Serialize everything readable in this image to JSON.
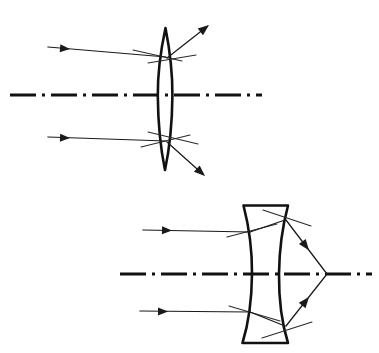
{
  "figure": {
    "width": 379,
    "height": 353,
    "background_color": "#ffffff",
    "ink_color": "#111111",
    "ray_color": "#1a1a1a"
  },
  "panels": [
    {
      "id": "top-panel",
      "name": "biconvex-lens-diagram",
      "lens_type": "biconvex",
      "lens_label": "converging lens",
      "optical_axis": {
        "label": "optical-axis",
        "y": 95,
        "x_start": 10,
        "x_end": 262,
        "style": "dash-dot"
      },
      "lens": {
        "center_x": 165,
        "top_y": 28,
        "bottom_y": 170,
        "half_width": 7,
        "left_vertex_x": 158,
        "right_vertex_x": 172
      },
      "incident_rays": [
        {
          "name": "incident-ray-upper",
          "x_start": 48,
          "y_start": 47,
          "x_end": 166,
          "y_end": 57,
          "arrow_at_x": 68,
          "arrow_at_y": 48,
          "direction": "rightward"
        },
        {
          "name": "incident-ray-lower",
          "x_start": 48,
          "y_start": 137,
          "x_end": 166,
          "y_end": 141,
          "arrow_at_x": 68,
          "arrow_at_y": 137,
          "direction": "rightward"
        }
      ],
      "refracted_rays": [
        {
          "name": "refracted-ray-upper",
          "x_start": 167,
          "y_start": 58,
          "x_end": 209,
          "y_end": 25,
          "direction": "up-right"
        },
        {
          "name": "refracted-ray-lower",
          "x_start": 167,
          "y_start": 142,
          "x_end": 205,
          "y_end": 176,
          "direction": "down-right"
        }
      ],
      "construction_marks": [
        {
          "name": "normal-mark-upper-entry",
          "x1": 133,
          "y1": 50,
          "x2": 182,
          "y2": 61
        },
        {
          "name": "normal-mark-upper-exit",
          "x1": 148,
          "y1": 63,
          "x2": 196,
          "y2": 55
        },
        {
          "name": "normal-mark-lower-entry",
          "x1": 141,
          "y1": 147,
          "x2": 190,
          "y2": 135
        },
        {
          "name": "normal-mark-lower-exit",
          "x1": 148,
          "y1": 132,
          "x2": 198,
          "y2": 144
        }
      ]
    },
    {
      "id": "bottom-panel",
      "name": "biconcave-lens-diagram",
      "lens_type": "biconcave",
      "lens_label": "diverging lens",
      "optical_axis": {
        "label": "optical-axis",
        "y": 274,
        "x_start": 120,
        "x_end": 372,
        "style": "dash-dot"
      },
      "lens": {
        "top_y": 205,
        "bottom_y": 343,
        "left_outer_x": 243,
        "right_outer_x": 288,
        "left_waist_x": 252,
        "right_waist_x": 279
      },
      "incident_rays": [
        {
          "name": "incident-ray-upper",
          "x_start": 143,
          "y_start": 230,
          "x_end": 250,
          "y_end": 232,
          "arrow_at_x": 170,
          "arrow_at_y": 230,
          "direction": "rightward"
        },
        {
          "name": "incident-ray-lower",
          "x_start": 140,
          "y_start": 311,
          "x_end": 250,
          "y_end": 312,
          "arrow_at_x": 166,
          "arrow_at_y": 311,
          "direction": "rightward"
        }
      ],
      "internal_rays": [
        {
          "name": "internal-ray-upper",
          "x_start": 250,
          "y_start": 232,
          "x_end": 285,
          "y_end": 220
        },
        {
          "name": "internal-ray-lower",
          "x_start": 250,
          "y_start": 312,
          "x_end": 285,
          "y_end": 326
        }
      ],
      "refracted_rays": [
        {
          "name": "refracted-ray-upper",
          "x_start": 286,
          "y_start": 220,
          "x_end": 327,
          "y_end": 274,
          "direction": "down-right-to-focus"
        },
        {
          "name": "refracted-ray-lower",
          "x_start": 286,
          "y_start": 326,
          "x_end": 327,
          "y_end": 274,
          "direction": "up-right-to-focus"
        }
      ],
      "focus_point": {
        "name": "convergence-point",
        "x": 327,
        "y": 274
      },
      "construction_marks": [
        {
          "name": "normal-mark-upper-entry",
          "x1": 227,
          "y1": 237,
          "x2": 277,
          "y2": 224
        },
        {
          "name": "normal-mark-upper-exit",
          "x1": 263,
          "y1": 210,
          "x2": 311,
          "y2": 226
        },
        {
          "name": "normal-mark-lower-entry",
          "x1": 229,
          "y1": 306,
          "x2": 280,
          "y2": 321
        },
        {
          "name": "normal-mark-lower-exit",
          "x1": 262,
          "y1": 338,
          "x2": 312,
          "y2": 322
        }
      ]
    }
  ]
}
